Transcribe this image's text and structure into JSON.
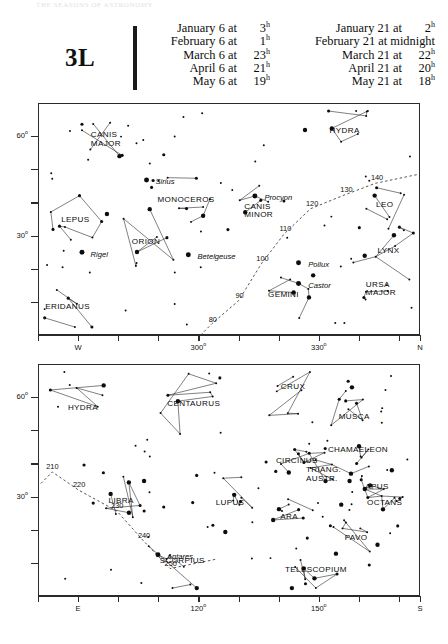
{
  "runhead": "THE  SEASONS  OF  ASTRONOMY",
  "header": {
    "chart_code": "3L",
    "epoch_columns": [
      {
        "rows": [
          {
            "date": "January 6 at",
            "time": "3",
            "sup": "h"
          },
          {
            "date": "February 6 at",
            "time": "1",
            "sup": "h"
          },
          {
            "date": "March 6 at",
            "time": "23",
            "sup": "h"
          },
          {
            "date": "April 6 at",
            "time": "21",
            "sup": "h"
          },
          {
            "date": "May 6 at",
            "time": "19",
            "sup": "h"
          }
        ]
      },
      {
        "rows": [
          {
            "date": "January 21 at",
            "time": "2",
            "sup": "h"
          },
          {
            "date": "February 21 at",
            "time": "midnight",
            "sup": ""
          },
          {
            "date": "March 21 at",
            "time": "22",
            "sup": "h"
          },
          {
            "date": "April 21 at",
            "time": "20",
            "sup": "h"
          },
          {
            "date": "May 21 at",
            "time": "18",
            "sup": "h"
          }
        ]
      }
    ]
  },
  "chart_data": {
    "type": "scatter",
    "title": "3L",
    "grid": false,
    "panels": [
      {
        "id": "north",
        "xlabel": "",
        "ylabel": "altitude",
        "ylim": [
          0,
          70
        ],
        "y_ticks": [
          {
            "value": 60,
            "label": "60",
            "sup": "o"
          },
          {
            "value": 50,
            "label": ""
          },
          {
            "value": 40,
            "label": ""
          },
          {
            "value": 30,
            "label": "30",
            "sup": "o"
          },
          {
            "value": 20,
            "label": ""
          },
          {
            "value": 10,
            "label": ""
          }
        ],
        "x_ticks": [
          {
            "pos": 0.0,
            "label": ""
          },
          {
            "pos": 0.105,
            "label": "W",
            "sup": ""
          },
          {
            "pos": 0.21,
            "label": ""
          },
          {
            "pos": 0.315,
            "label": ""
          },
          {
            "pos": 0.42,
            "label": "300",
            "sup": "o"
          },
          {
            "pos": 0.525,
            "label": ""
          },
          {
            "pos": 0.63,
            "label": ""
          },
          {
            "pos": 0.735,
            "label": "330",
            "sup": "o"
          },
          {
            "pos": 0.84,
            "label": ""
          },
          {
            "pos": 0.945,
            "label": ""
          },
          {
            "pos": 1.0,
            "label": "N",
            "sup": ""
          }
        ],
        "constellations": [
          {
            "name": "CANIS\nMAJOR",
            "x": 0.175,
            "y": 0.155
          },
          {
            "name": "MONOCEROS",
            "x": 0.385,
            "y": 0.415
          },
          {
            "name": "LEPUS",
            "x": 0.095,
            "y": 0.5
          },
          {
            "name": "ORION",
            "x": 0.28,
            "y": 0.595
          },
          {
            "name": "ERIDANUS",
            "x": 0.075,
            "y": 0.875
          },
          {
            "name": "HYDRA",
            "x": 0.8,
            "y": 0.115
          },
          {
            "name": "CANIS\nMINOR",
            "x": 0.575,
            "y": 0.465
          },
          {
            "name": "GEMINI",
            "x": 0.64,
            "y": 0.825
          },
          {
            "name": "LEO",
            "x": 0.905,
            "y": 0.435
          },
          {
            "name": "LYNX",
            "x": 0.915,
            "y": 0.635
          },
          {
            "name": "URSA\nMAJOR",
            "x": 0.895,
            "y": 0.8
          }
        ],
        "stars": [
          {
            "name": "Sirius",
            "x": 0.305,
            "y": 0.33
          },
          {
            "name": "Procyon",
            "x": 0.59,
            "y": 0.4
          },
          {
            "name": "Rigel",
            "x": 0.135,
            "y": 0.645
          },
          {
            "name": "Betelgeuse",
            "x": 0.415,
            "y": 0.655
          },
          {
            "name": "Pollux",
            "x": 0.705,
            "y": 0.69
          },
          {
            "name": "Castor",
            "x": 0.705,
            "y": 0.78
          }
        ],
        "galactic_longitudes": [
          {
            "label": "80",
            "x": 0.455,
            "y": 0.955
          },
          {
            "label": "90",
            "x": 0.525,
            "y": 0.855
          },
          {
            "label": "100",
            "x": 0.585,
            "y": 0.695
          },
          {
            "label": "110",
            "x": 0.645,
            "y": 0.565
          },
          {
            "label": "120",
            "x": 0.715,
            "y": 0.455
          },
          {
            "label": "130",
            "x": 0.805,
            "y": 0.395
          },
          {
            "label": "140",
            "x": 0.885,
            "y": 0.345
          }
        ]
      },
      {
        "id": "south",
        "xlabel": "",
        "ylabel": "altitude",
        "ylim": [
          0,
          70
        ],
        "y_ticks": [
          {
            "value": 60,
            "label": "60",
            "sup": "o"
          },
          {
            "value": 50,
            "label": ""
          },
          {
            "value": 40,
            "label": ""
          },
          {
            "value": 30,
            "label": "30",
            "sup": "o"
          },
          {
            "value": 20,
            "label": ""
          },
          {
            "value": 10,
            "label": ""
          }
        ],
        "x_ticks": [
          {
            "pos": 0.0,
            "label": ""
          },
          {
            "pos": 0.105,
            "label": "E",
            "sup": ""
          },
          {
            "pos": 0.21,
            "label": ""
          },
          {
            "pos": 0.315,
            "label": ""
          },
          {
            "pos": 0.42,
            "label": "120",
            "sup": "o"
          },
          {
            "pos": 0.525,
            "label": ""
          },
          {
            "pos": 0.63,
            "label": ""
          },
          {
            "pos": 0.735,
            "label": "150",
            "sup": "o"
          },
          {
            "pos": 0.84,
            "label": ""
          },
          {
            "pos": 0.945,
            "label": ""
          },
          {
            "pos": 1.0,
            "label": "S",
            "sup": ""
          }
        ],
        "constellations": [
          {
            "name": "HYDRA",
            "x": 0.115,
            "y": 0.185
          },
          {
            "name": "CENTAURUS",
            "x": 0.405,
            "y": 0.17
          },
          {
            "name": "CRUX",
            "x": 0.665,
            "y": 0.095
          },
          {
            "name": "MUSCA",
            "x": 0.825,
            "y": 0.225
          },
          {
            "name": "CHAMAELEON",
            "x": 0.835,
            "y": 0.365
          },
          {
            "name": "CIRCINUS",
            "x": 0.675,
            "y": 0.415
          },
          {
            "name": "TRIANG.\nAUSTR.",
            "x": 0.745,
            "y": 0.475
          },
          {
            "name": "APUS",
            "x": 0.885,
            "y": 0.525
          },
          {
            "name": "OCTANS",
            "x": 0.905,
            "y": 0.595
          },
          {
            "name": "LIBRA",
            "x": 0.215,
            "y": 0.585
          },
          {
            "name": "LUPUS",
            "x": 0.5,
            "y": 0.595
          },
          {
            "name": "ARA",
            "x": 0.655,
            "y": 0.655
          },
          {
            "name": "PAVO",
            "x": 0.83,
            "y": 0.745
          },
          {
            "name": "SCORPIUS",
            "x": 0.375,
            "y": 0.845
          },
          {
            "name": "TELESCOPIUM",
            "x": 0.725,
            "y": 0.885
          }
        ],
        "stars": [
          {
            "name": "Antares",
            "x": 0.335,
            "y": 0.825
          }
        ],
        "galactic_longitudes": [
          {
            "label": "210",
            "x": 0.035,
            "y": 0.465
          },
          {
            "label": "220",
            "x": 0.105,
            "y": 0.545
          },
          {
            "label": "230",
            "x": 0.205,
            "y": 0.635
          },
          {
            "label": "240",
            "x": 0.275,
            "y": 0.765
          },
          {
            "label": "250",
            "x": 0.345,
            "y": 0.885
          }
        ]
      }
    ]
  }
}
